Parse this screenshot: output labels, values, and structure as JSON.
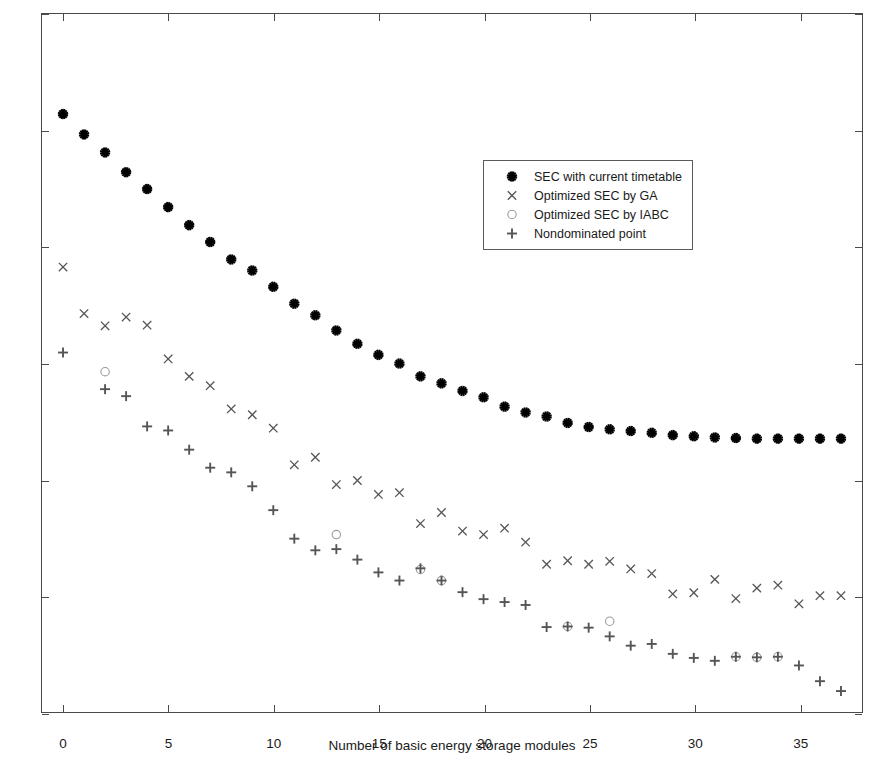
{
  "chart_data": {
    "type": "scatter",
    "title": "",
    "xlabel": "Number of basic energy storage modules",
    "ylabel": "Substation energy consumption (MWh)",
    "xlim": [
      -1,
      38
    ],
    "ylim": [
      46,
      58
    ],
    "xticks": [
      0,
      5,
      10,
      15,
      20,
      25,
      30,
      35
    ],
    "yticks": [
      46,
      48,
      50,
      52,
      54,
      56,
      58
    ],
    "xtick_labels": [
      "0",
      "5",
      "10",
      "15",
      "20",
      "25",
      "30",
      "35"
    ],
    "ytick_labels": [
      "46",
      "48",
      "50",
      "52",
      "54",
      "56",
      "58"
    ],
    "grid": false,
    "legend_position": "upper-right-inside",
    "series": [
      {
        "name": "SEC with current timetable",
        "marker": "star",
        "color": "#000000",
        "x": [
          0,
          1,
          2,
          3,
          4,
          5,
          6,
          7,
          8,
          9,
          10,
          11,
          12,
          13,
          14,
          15,
          16,
          17,
          18,
          19,
          20,
          21,
          22,
          23,
          24,
          25,
          26,
          27,
          28,
          29,
          30,
          31,
          32,
          33,
          34,
          35,
          36,
          37
        ],
        "values": [
          56.28,
          55.93,
          55.62,
          55.28,
          54.99,
          54.68,
          54.37,
          54.08,
          53.78,
          53.59,
          53.31,
          53.02,
          52.82,
          52.56,
          52.33,
          52.14,
          51.99,
          51.77,
          51.65,
          51.52,
          51.41,
          51.25,
          51.15,
          51.08,
          50.97,
          50.9,
          50.86,
          50.83,
          50.8,
          50.76,
          50.74,
          50.72,
          50.71,
          50.7,
          50.7,
          50.7,
          50.7,
          50.7
        ]
      },
      {
        "name": "Optimized SEC by GA",
        "marker": "x",
        "color": "#555555",
        "x": [
          0,
          1,
          2,
          3,
          4,
          5,
          6,
          7,
          8,
          9,
          10,
          11,
          12,
          13,
          14,
          15,
          16,
          17,
          18,
          19,
          20,
          21,
          22,
          23,
          24,
          25,
          26,
          27,
          28,
          29,
          30,
          31,
          32,
          33,
          34,
          35,
          36,
          37
        ],
        "values": [
          53.65,
          52.85,
          52.64,
          52.79,
          52.65,
          52.07,
          51.77,
          51.61,
          51.21,
          51.11,
          50.88,
          50.25,
          50.38,
          49.91,
          49.98,
          49.74,
          49.77,
          49.24,
          49.43,
          49.11,
          49.05,
          49.16,
          48.92,
          48.54,
          48.6,
          48.54,
          48.59,
          48.46,
          48.38,
          48.03,
          48.05,
          48.28,
          47.95,
          48.13,
          48.18,
          47.86,
          48.0,
          48.0
        ]
      },
      {
        "name": "Optimized SEC by IABC",
        "marker": "circle",
        "color": "#9a9a9a",
        "x": [
          2,
          13,
          17,
          18,
          24,
          26,
          32,
          33,
          34
        ],
        "values": [
          51.85,
          49.05,
          48.45,
          48.26,
          47.47,
          47.56,
          46.95,
          46.94,
          46.95
        ]
      },
      {
        "name": "Nondominated point",
        "marker": "plus",
        "color": "#555555",
        "x": [
          0,
          2,
          3,
          4,
          5,
          6,
          7,
          8,
          9,
          10,
          11,
          12,
          13,
          14,
          15,
          16,
          17,
          18,
          19,
          20,
          21,
          22,
          23,
          24,
          25,
          26,
          27,
          28,
          29,
          30,
          31,
          32,
          33,
          34,
          35,
          36,
          37
        ],
        "values": [
          52.18,
          51.55,
          51.43,
          50.91,
          50.84,
          50.51,
          50.2,
          50.12,
          49.88,
          49.47,
          48.98,
          48.78,
          48.8,
          48.62,
          48.4,
          48.26,
          48.47,
          48.26,
          48.06,
          47.94,
          47.89,
          47.84,
          47.46,
          47.47,
          47.45,
          47.3,
          47.14,
          47.17,
          47.0,
          46.93,
          46.88,
          46.95,
          46.94,
          46.95,
          46.8,
          46.53,
          46.36
        ]
      }
    ]
  },
  "legend": {
    "entries": [
      {
        "label": "SEC with current timetable",
        "marker": "star"
      },
      {
        "label": "Optimized SEC by GA",
        "marker": "x"
      },
      {
        "label": "Optimized SEC by IABC",
        "marker": "circle"
      },
      {
        "label": "Nondominated point",
        "marker": "plus"
      }
    ]
  }
}
